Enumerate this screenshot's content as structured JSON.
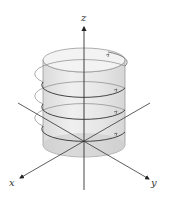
{
  "figure": {
    "axes": {
      "z_label": "z",
      "x_label": "x",
      "y_label": "y"
    },
    "colors": {
      "axis": "#444444",
      "cylinder_fill": "#e6e6e6",
      "cylinder_edge": "#9a9a9a",
      "helix": "#555555",
      "background": "#ffffff"
    }
  }
}
